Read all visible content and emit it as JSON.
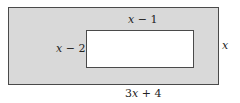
{
  "diagram": {
    "type": "nested-rectangles",
    "outer_rectangle": {
      "fill": "#d9d9d9",
      "stroke": "#4a4a4a",
      "width_label": "3x + 4",
      "height_label": "x"
    },
    "inner_rectangle": {
      "fill": "#ffffff",
      "stroke": "#4a4a4a",
      "width_label": "x − 1",
      "height_label": "x − 2"
    },
    "labels": {
      "top": {
        "var": "x",
        "rest": " − 1"
      },
      "left": {
        "var": "x",
        "rest": " − 2"
      },
      "right": {
        "var": "x",
        "rest": ""
      },
      "bottom": {
        "prefix": "3",
        "var": "x",
        "rest": " + 4"
      }
    }
  }
}
